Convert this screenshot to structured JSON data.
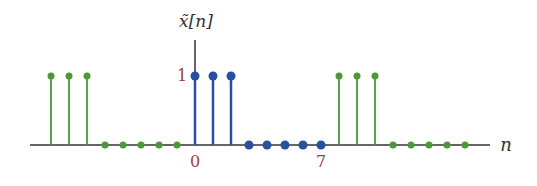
{
  "chart_data": {
    "type": "stem",
    "title": "",
    "ylabel": "x̃[n]",
    "xlabel": "n",
    "x_tick_labels": [
      {
        "n": 0,
        "label": "0"
      },
      {
        "n": 7,
        "label": "7"
      }
    ],
    "y_tick_labels": [
      {
        "y": 1,
        "label": "1"
      }
    ],
    "period": 8,
    "series": [
      {
        "name": "primary period",
        "color": "#2a4fa0",
        "x": [
          0,
          1,
          2,
          3,
          4,
          5,
          6,
          7
        ],
        "values": [
          1,
          1,
          1,
          0,
          0,
          0,
          0,
          0
        ]
      },
      {
        "name": "periodic extension",
        "color": "#4a9a36",
        "x": [
          -8,
          -7,
          -6,
          -5,
          -4,
          -3,
          -2,
          -1,
          8,
          9,
          10,
          11,
          12,
          13,
          14,
          15
        ],
        "values": [
          1,
          1,
          1,
          0,
          0,
          0,
          0,
          0,
          1,
          1,
          1,
          0,
          0,
          0,
          0,
          0
        ]
      }
    ],
    "xlim": [
      -9,
      16
    ],
    "ylim": [
      0,
      1
    ],
    "grid": false,
    "legend": "none"
  },
  "labels": {
    "y_axis_label": "x̃[n]",
    "x_axis_label": "n",
    "tick_zero": "0",
    "tick_seven": "7",
    "tick_one": "1"
  },
  "colors": {
    "blue": "#2a4fa0",
    "green": "#4a9a36",
    "axis": "#333333",
    "tick_label": "#a0403a"
  }
}
